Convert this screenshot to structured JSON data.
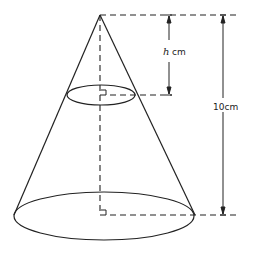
{
  "diagram": {
    "type": "cone-with-cross-section",
    "labels": {
      "small_height_var": "h",
      "small_height_unit": "cm",
      "total_height": "10cm"
    },
    "colors": {
      "stroke": "#222222",
      "background": "#ffffff"
    }
  }
}
